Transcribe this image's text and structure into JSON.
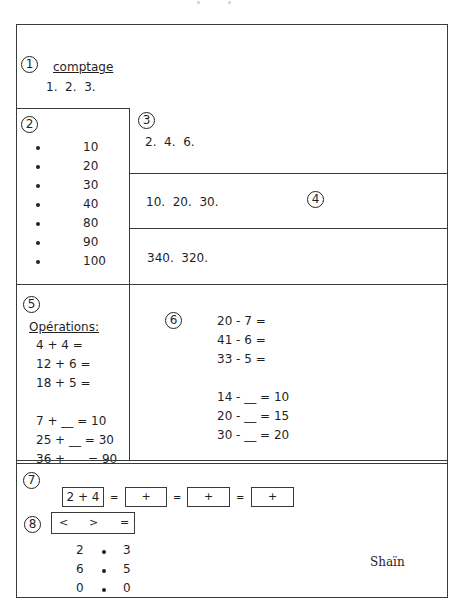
{
  "sections": {
    "s1": {
      "number": "1",
      "title": "comptage",
      "sequence": "1.  2.  3."
    },
    "s2": {
      "number": "2",
      "items": [
        "10",
        "20",
        "30",
        "40",
        "80",
        "90",
        "100"
      ]
    },
    "s3": {
      "number": "3",
      "sequence": "2.  4.  6."
    },
    "s4": {
      "number": "4",
      "sequence_a": "10.  20.  30.",
      "sequence_b": "340.  320."
    },
    "s5": {
      "number": "5",
      "title": "Opérations:",
      "lines": [
        "4 + 4 =",
        "12 + 6 =",
        "18 + 5 =",
        "7 + __ = 10",
        "25 + __ = 30",
        "36 +      = 90"
      ]
    },
    "s6": {
      "number": "6",
      "lines": [
        "20 - 7 =",
        "41 - 6 =",
        "33 - 5 =",
        "14 - __ = 10",
        "20 - __ = 15",
        "30 - __ = 20"
      ]
    },
    "s7": {
      "number": "7",
      "first_box": "2 + 4",
      "equals": "=",
      "boxes": [
        "+",
        "+",
        "+"
      ]
    },
    "s8": {
      "number": "8",
      "symbols": [
        "<",
        ">",
        "="
      ],
      "comparisons": [
        {
          "left": "2",
          "right": "3"
        },
        {
          "left": "6",
          "right": "5"
        },
        {
          "left": "0",
          "right": "0"
        }
      ]
    }
  },
  "signature": "Shaïn"
}
